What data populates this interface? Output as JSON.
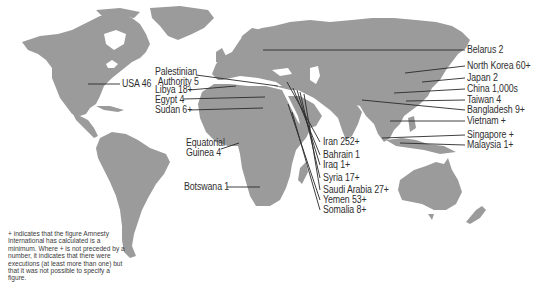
{
  "map": {
    "land_color": "#9b9b9b",
    "background_color": "#ffffff",
    "leader_color": "#2a2a2a",
    "text_color": "#2f2f2f"
  },
  "labels": {
    "usa": "USA 46",
    "palestinian_authority_line1": "Palestinian",
    "palestinian_authority_line2": "Authority 5",
    "libya": "Libya 18+",
    "egypt": "Egypt 4",
    "sudan": "Sudan 6+",
    "equatorial_guinea_line1": "Equatorial",
    "equatorial_guinea_line2": "Guinea 4",
    "botswana": "Botswana 1",
    "iran": "Iran 252+",
    "bahrain": "Bahrain 1",
    "iraq": "Iraq 1+",
    "syria": "Syria 17+",
    "saudi_arabia": "Saudi Arabia 27+",
    "yemen": "Yemen 53+",
    "somalia": "Somalia 8+",
    "belarus": "Belarus 2",
    "north_korea": "North Korea 60+",
    "japan": "Japan 2",
    "china": "China 1,000s",
    "taiwan": "Taiwan 4",
    "bangladesh": "Bangladesh 9+",
    "vietnam": "Vietnam +",
    "singapore": "Singapore +",
    "malaysia": "Malaysia 1+"
  },
  "note": "+ indicates that the figure Amnesty International has calculated is a minimum. Where + is not preceded by a number, it indicates that there were executions (at least more than one) but that it was not possible to specify a figure."
}
